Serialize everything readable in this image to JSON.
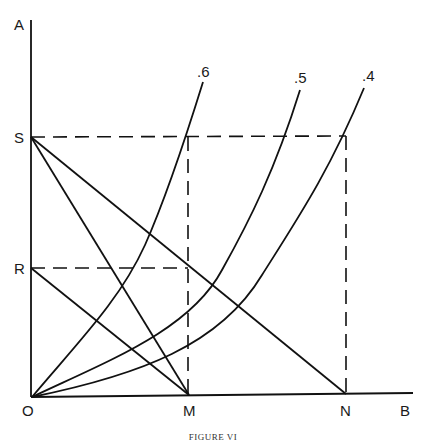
{
  "figure": {
    "caption": "FIGURE VI",
    "axes": {
      "y_label": "A",
      "x_label": "B",
      "origin_label": "O"
    },
    "points": {
      "S": "S",
      "R": "R",
      "M": "M",
      "N": "N"
    },
    "curves": [
      {
        "label": ".6"
      },
      {
        "label": ".5"
      },
      {
        "label": ".4"
      }
    ]
  }
}
